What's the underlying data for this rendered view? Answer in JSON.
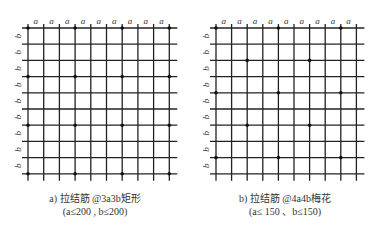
{
  "diagrams": [
    {
      "id": "a",
      "caption_line1": "a) 拉结筋 @3a3b矩形",
      "caption_line2": "(a≤200 , b≤200)",
      "col_label": "a",
      "row_label": "b",
      "columns": 10,
      "rows": 10,
      "origin_x": 28,
      "origin_y": 28,
      "spacing_x": 15.7,
      "spacing_y": 16.2,
      "pattern": "rectangular",
      "tie_points": [
        [
          0,
          0
        ],
        [
          0,
          3
        ],
        [
          0,
          6
        ],
        [
          0,
          9
        ],
        [
          3,
          0
        ],
        [
          3,
          3
        ],
        [
          3,
          6
        ],
        [
          3,
          9
        ],
        [
          6,
          0
        ],
        [
          6,
          3
        ],
        [
          6,
          6
        ],
        [
          6,
          9
        ],
        [
          9,
          0
        ],
        [
          9,
          3
        ],
        [
          9,
          6
        ],
        [
          9,
          9
        ]
      ]
    },
    {
      "id": "b",
      "caption_line1": "b) 拉结筋 @4a4b梅花",
      "caption_line2": "(a≤ 150 、b≤150)",
      "col_label": "a",
      "row_label": "b",
      "columns": 10,
      "rows": 10,
      "origin_x": 216,
      "origin_y": 28,
      "spacing_x": 15.6,
      "spacing_y": 16.2,
      "pattern": "quincunx",
      "tie_points": [
        [
          0,
          0
        ],
        [
          0,
          4
        ],
        [
          0,
          8
        ],
        [
          2,
          2
        ],
        [
          2,
          6
        ],
        [
          4,
          0
        ],
        [
          4,
          4
        ],
        [
          4,
          8
        ],
        [
          6,
          2
        ],
        [
          6,
          6
        ],
        [
          8,
          0
        ],
        [
          8,
          4
        ],
        [
          8,
          8
        ]
      ]
    }
  ],
  "colors": {
    "line": "#222222",
    "dot": "#111111",
    "text": "#333333"
  }
}
